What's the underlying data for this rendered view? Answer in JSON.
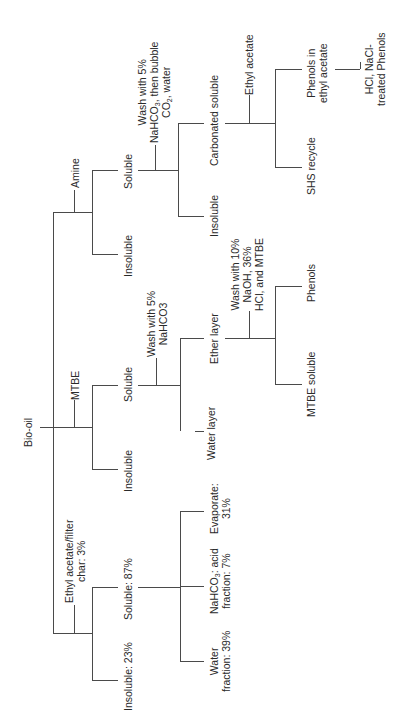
{
  "diagram": {
    "root": "Bio-oil",
    "orientation": "rotated -90deg (read bottom-to-top)",
    "line_color": "#4a4a4a",
    "text_color": "#2a2a2a",
    "branches": {
      "amine": {
        "solvent": "Amine",
        "soluble": "Soluble",
        "insoluble": "Insoluble",
        "wash": {
          "line1": "Wash with 5%",
          "line2_pre": "NaHCO",
          "line2_sub": "3",
          "line2_post": ", then bubble",
          "line3_pre": "CO",
          "line3_sub": "2",
          "line3_post": ", water"
        },
        "carbonated_soluble": "Carbonated soluble",
        "insoluble_after_wash": "Insoluble",
        "ethyl_acetate": "Ethyl acetate",
        "phenols_in_ea": {
          "line1": "Phenols in",
          "line2": "ethyl acetate"
        },
        "shs_recycle": "SHS recycle",
        "final": {
          "line1": "HCl, NaCl-",
          "line2": "treated  Phenols"
        }
      },
      "mtbe": {
        "solvent": "MTBE",
        "soluble": "Soluble",
        "insoluble": "Insoluble",
        "wash": {
          "line1": "Wash with 5%",
          "line2": "NaHCO3"
        },
        "ether_layer": "Ether layer",
        "water_layer": "Water layer",
        "wash2": {
          "line1": "Wash with 10%",
          "line2": "NaOH, 36%",
          "line3": "HCl, and MTBE"
        },
        "phenols": "Phenols",
        "mtbe_soluble": "MTBE  soluble"
      },
      "ethyl_acetate_filter": {
        "solvent": {
          "line1": "Ethyl acetate/filter",
          "line2": "char: 3%"
        },
        "soluble": "Soluble: 87%",
        "insoluble": "Insoluble: 23%",
        "evaporate": {
          "line1": "Evaporate:",
          "line2": "31%"
        },
        "nahco3_acid": {
          "line1_pre": "NaHCO",
          "line1_sub": "3",
          "line1_post": ": acid",
          "line2": "fraction: 7%"
        },
        "water_fraction": {
          "line1": "Water",
          "line2": "fraction: 39%"
        }
      }
    }
  }
}
